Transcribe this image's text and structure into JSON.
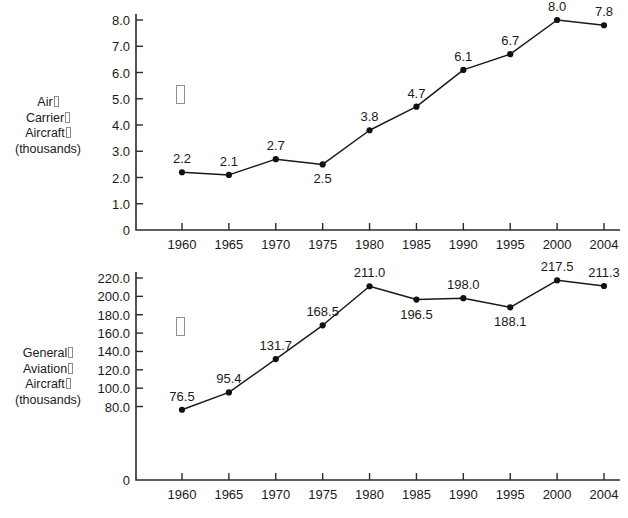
{
  "chart_data": [
    {
      "id": "air-carrier",
      "type": "line",
      "title": "",
      "ylabel_lines": [
        "Air",
        "Carrier",
        "Aircraft",
        "(thousands)"
      ],
      "ylabel_tofu_lines": [
        true,
        true,
        true,
        false
      ],
      "xlabel": "",
      "ylabel": "Air Carrier Aircraft (thousands)",
      "categories": [
        "1960",
        "1965",
        "1970",
        "1975",
        "1980",
        "1985",
        "1990",
        "1995",
        "2000",
        "2004"
      ],
      "values": [
        2.2,
        2.1,
        2.7,
        2.5,
        3.8,
        4.7,
        6.1,
        6.7,
        8.0,
        7.8
      ],
      "point_labels": [
        "2.2",
        "2.1",
        "2.7",
        "2.5",
        "3.8",
        "4.7",
        "6.1",
        "6.7",
        "8.0",
        "7.8"
      ],
      "label_positions": [
        "above",
        "above",
        "above",
        "below",
        "above",
        "above",
        "above",
        "above",
        "above",
        "above"
      ],
      "yticks": [
        8.0,
        7.0,
        6.0,
        5.0,
        4.0,
        3.0,
        2.0,
        1.0,
        0
      ],
      "ytick_labels": [
        "8.0",
        "7.0",
        "6.0",
        "5.0",
        "4.0",
        "3.0",
        "2.0",
        "1.0",
        "0"
      ],
      "ylim": [
        0,
        8.0
      ],
      "grid": false,
      "legend": "none",
      "stray_glyph": "missing-glyph-box"
    },
    {
      "id": "general-aviation",
      "type": "line",
      "title": "",
      "ylabel_lines": [
        "General",
        "Aviation",
        "Aircraft",
        "(thousands)"
      ],
      "ylabel_tofu_lines": [
        true,
        true,
        true,
        false
      ],
      "xlabel": "",
      "ylabel": "General Aviation Aircraft (thousands)",
      "categories": [
        "1960",
        "1965",
        "1970",
        "1975",
        "1980",
        "1985",
        "1990",
        "1995",
        "2000",
        "2004"
      ],
      "values": [
        76.5,
        95.4,
        131.7,
        168.5,
        211.0,
        196.5,
        198.0,
        188.1,
        217.5,
        211.3
      ],
      "point_labels": [
        "76.5",
        "95.4",
        "131.7",
        "168.5",
        "211.0",
        "196.5",
        "198.0",
        "188.1",
        "217.5",
        "211.3"
      ],
      "label_positions": [
        "above",
        "above",
        "above",
        "above",
        "above",
        "below",
        "above",
        "below",
        "above",
        "above"
      ],
      "yticks": [
        220.0,
        200.0,
        180.0,
        160.0,
        140.0,
        120.0,
        100.0,
        80.0,
        0
      ],
      "ytick_labels": [
        "220.0",
        "200.0",
        "180.0",
        "160.0",
        "140.0",
        "120.0",
        "100.0",
        "80.0",
        "0"
      ],
      "ylim": [
        0,
        220.0
      ],
      "grid": false,
      "legend": "none",
      "stray_glyph": "missing-glyph-box"
    }
  ],
  "colors": {
    "background": "#ffffff",
    "line": "#1a1a1a",
    "marker": "#111111",
    "axis": "#2b2b2b",
    "text": "#1a1a1a",
    "tofu_border": "#8e8e8e"
  }
}
